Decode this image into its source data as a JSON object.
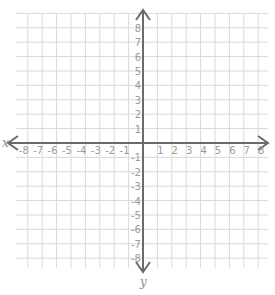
{
  "chart_data": {
    "type": "coordinate-plane",
    "title": "",
    "xlabel": "x",
    "ylabel": "y",
    "xlim": [
      -8,
      8
    ],
    "ylim": [
      -8,
      8
    ],
    "grid": true,
    "x_ticks": [
      -8,
      -7,
      -6,
      -5,
      -4,
      -3,
      -2,
      -1,
      1,
      2,
      3,
      4,
      5,
      6,
      7,
      8
    ],
    "y_ticks": [
      8,
      7,
      6,
      5,
      4,
      3,
      2,
      1,
      -1,
      -2,
      -3,
      -4,
      -5,
      -6,
      -7,
      -8
    ],
    "arrows": "both ends on both axes"
  },
  "colors": {
    "grid": "#d9d9d9",
    "axis": "#6b6b6b",
    "labels": "#9a9a9a"
  }
}
